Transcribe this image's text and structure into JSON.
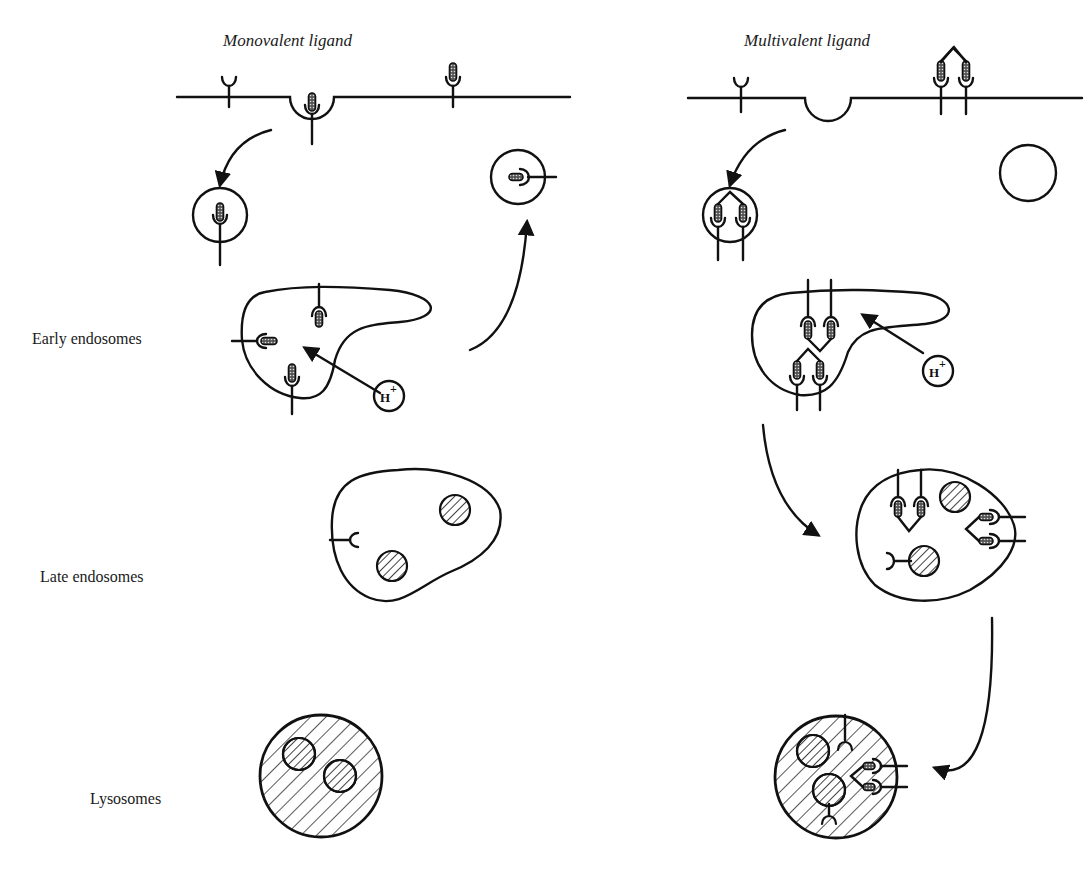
{
  "figure": {
    "columns": [
      {
        "id": "monovalent",
        "title": "Monovalent ligand"
      },
      {
        "id": "multivalent",
        "title": "Multivalent ligand"
      }
    ],
    "row_labels": {
      "early": "Early endosomes",
      "late": "Late endosomes",
      "lysosomes": "Lysosomes"
    },
    "proton_label": {
      "base": "H",
      "sup": "+"
    },
    "colors": {
      "ink": "#111111",
      "background": "#ffffff"
    }
  }
}
